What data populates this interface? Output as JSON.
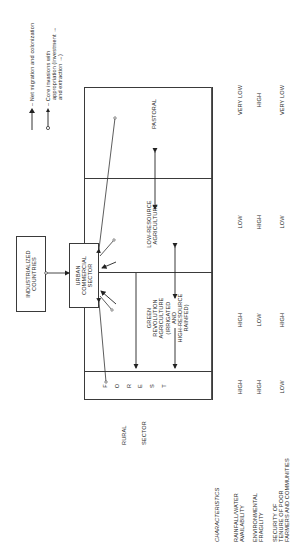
{
  "legend": {
    "items": [
      {
        "icon": "solid-arrow-icon",
        "label": "Net migration and colonization"
      },
      {
        "icon": "open-arrow-icon",
        "label_lines": [
          "Core invasions with",
          "appropriation (investment →",
          "and extraction →)"
        ]
      }
    ]
  },
  "boxes": {
    "industrialized": {
      "lines": [
        "INDUSTRIALIZED",
        "COUNTRIES"
      ]
    },
    "urban": {
      "lines": [
        "URBAN",
        "COMMERCIAL",
        "SECTOR"
      ]
    }
  },
  "rural_sector": {
    "label_lines": [
      "RURAL",
      "SECTOR"
    ],
    "zones": [
      {
        "name": "forest",
        "letters": [
          "F",
          "O",
          "R",
          "E",
          "S",
          "T"
        ]
      },
      {
        "name": "green-revolution",
        "lines": [
          "GREEN",
          "REVOLUTION",
          "AGRICULTURE",
          "(IRRIGATED",
          "AND",
          "HIGH-RESOURCE",
          "RAINFED)"
        ]
      },
      {
        "name": "low-resource",
        "lines": [
          "LOW-RESOURCE",
          "AGRICULTURE"
        ]
      },
      {
        "name": "pastoral",
        "lines": [
          "PASTORAL"
        ]
      }
    ]
  },
  "characteristics": {
    "header": "CHARACTERISTICS",
    "rows": [
      {
        "label_lines": [
          "RAINFALL/WATER",
          "AVAILABILITY"
        ],
        "values": [
          "HIGH",
          "HIGH",
          "LOW",
          "VERY LOW"
        ]
      },
      {
        "label_lines": [
          "ENVIRONMENTAL",
          "FRAGILITY"
        ],
        "values": [
          "HIGH",
          "LOW",
          "HIGH",
          "HIGH"
        ]
      },
      {
        "label_lines": [
          "SECURITY OF",
          "TENURE OF POOR",
          "FARMERS AND COMMUNITIES"
        ],
        "values": [
          "LOW",
          "HIGH",
          "LOW",
          "VERY LOW"
        ]
      }
    ]
  }
}
